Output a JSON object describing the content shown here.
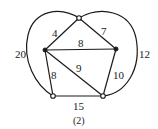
{
  "figure": {
    "caption": "(2)",
    "type": "weighted-graph"
  },
  "nodes": [
    {
      "id": "top",
      "style": "open"
    },
    {
      "id": "left",
      "style": "filled"
    },
    {
      "id": "right",
      "style": "filled"
    },
    {
      "id": "bottom-left",
      "style": "open"
    },
    {
      "id": "bottom-right",
      "style": "open"
    }
  ],
  "edges": [
    {
      "from": "top",
      "to": "left",
      "weight": "4"
    },
    {
      "from": "top",
      "to": "right",
      "weight": "7"
    },
    {
      "from": "left",
      "to": "right",
      "weight": "8"
    },
    {
      "from": "left",
      "to": "bottom-left",
      "weight": "8"
    },
    {
      "from": "left",
      "to": "bottom-right",
      "weight": "9"
    },
    {
      "from": "right",
      "to": "bottom-right",
      "weight": "10"
    },
    {
      "from": "bottom-left",
      "to": "bottom-right",
      "weight": "15"
    },
    {
      "from": "top",
      "to": "bottom-left",
      "weight": "20",
      "curved": true
    },
    {
      "from": "top",
      "to": "bottom-right",
      "weight": "12",
      "curved": true
    }
  ],
  "colors": {
    "stroke": "#1a1a1a",
    "background": "#ffffff"
  }
}
